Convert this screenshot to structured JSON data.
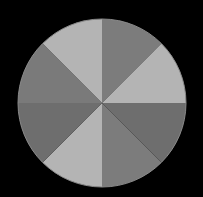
{
  "figure": {
    "background": "#000000",
    "center": [
      102,
      103
    ],
    "radius": 84,
    "outline": "#8a8a8a",
    "sectors": [
      {
        "start": -90,
        "end": -45,
        "color": "#7c7c7c"
      },
      {
        "start": -45,
        "end": 0,
        "color": "#b4b4b4"
      },
      {
        "start": 0,
        "end": 45,
        "color": "#6e6e6e"
      },
      {
        "start": 45,
        "end": 90,
        "color": "#7c7c7c"
      },
      {
        "start": 90,
        "end": 135,
        "color": "#b4b4b4"
      },
      {
        "start": 135,
        "end": 180,
        "color": "#6e6e6e"
      },
      {
        "start": 180,
        "end": 225,
        "color": "#7a7a7a"
      },
      {
        "start": 225,
        "end": 270,
        "color": "#b4b4b4"
      }
    ]
  }
}
